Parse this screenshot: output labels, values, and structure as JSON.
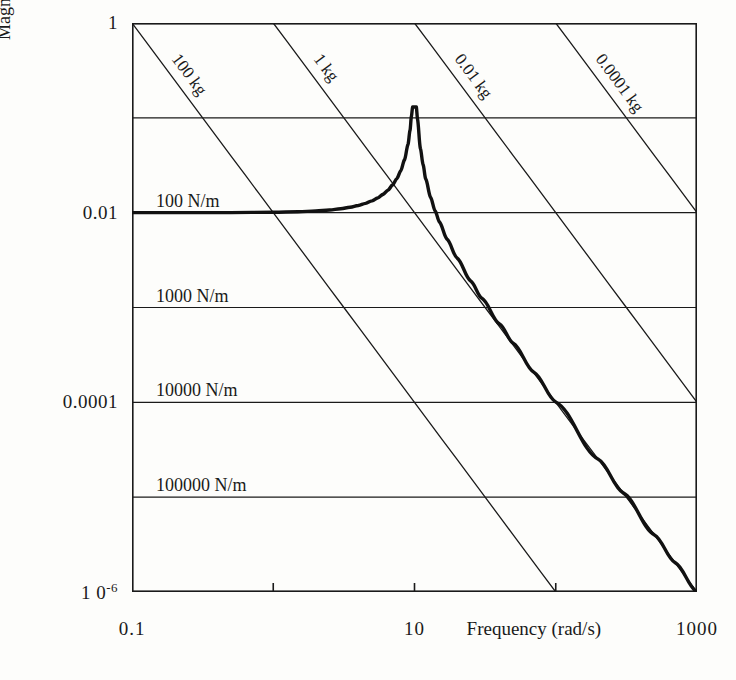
{
  "chart_data": {
    "type": "line",
    "title": "",
    "xlabel": "Frequency (rad/s)",
    "ylabel": "Magnitude of receptance (m/N)",
    "xscale": "log",
    "yscale": "log",
    "xlim": [
      0.1,
      1000
    ],
    "ylim": [
      1e-06,
      1
    ],
    "grid": true,
    "legend": "none",
    "x_ticks": [
      {
        "value": 0.1,
        "label": "0.1"
      },
      {
        "value": 1,
        "label": ""
      },
      {
        "value": 10,
        "label": "10"
      },
      {
        "value": 100,
        "label": ""
      },
      {
        "value": 1000,
        "label": "1000"
      }
    ],
    "y_ticks": [
      {
        "value": 1,
        "label": "1"
      },
      {
        "value": 0.1,
        "label": ""
      },
      {
        "value": 0.01,
        "label": "0.01"
      },
      {
        "value": 0.001,
        "label": ""
      },
      {
        "value": 0.0001,
        "label": "0.0001"
      },
      {
        "value": 1e-05,
        "label": ""
      },
      {
        "value": 1e-06,
        "label": "1 0",
        "label_sup": "-6"
      }
    ],
    "stiffness_lines": [
      {
        "label": "100 N/m",
        "receptance": 0.01
      },
      {
        "label": "1000 N/m",
        "receptance": 0.001
      },
      {
        "label": "10000 N/m",
        "receptance": 0.0001
      },
      {
        "label": "100000 N/m",
        "receptance": 1e-05
      }
    ],
    "mass_lines": [
      {
        "label": "100 kg",
        "mass_kg": 100,
        "x_at_top": 0.1
      },
      {
        "label": "1 kg",
        "mass_kg": 1,
        "x_at_top": 1
      },
      {
        "label": "0.01 kg",
        "mass_kg": 0.01,
        "x_at_top": 10
      },
      {
        "label": "0.0001 kg",
        "mass_kg": 0.0001,
        "x_at_top": 100
      }
    ],
    "series": [
      {
        "name": "receptance",
        "comment": "single-DOF receptance: stiffness k=100 N/m asymptote at low frequency, resonance peak at 10 rad/s, mass asymptote m=1 kg above resonance",
        "resonance_rad_s": 10,
        "low_freq_asymptote": 0.01,
        "peak_value": 0.13,
        "points": [
          [
            0.1,
            0.01
          ],
          [
            0.2,
            0.01
          ],
          [
            0.5,
            0.01002
          ],
          [
            1.0,
            0.0101
          ],
          [
            1.5,
            0.01023
          ],
          [
            2.0,
            0.01042
          ],
          [
            2.5,
            0.01067
          ],
          [
            3.0,
            0.01099
          ],
          [
            3.5,
            0.0114
          ],
          [
            4.0,
            0.0119
          ],
          [
            4.5,
            0.01253
          ],
          [
            5.0,
            0.01333
          ],
          [
            5.5,
            0.01434
          ],
          [
            6.0,
            0.01563
          ],
          [
            6.5,
            0.01732
          ],
          [
            7.0,
            0.01961
          ],
          [
            7.5,
            0.02286
          ],
          [
            8.0,
            0.02778
          ],
          [
            8.5,
            0.03613
          ],
          [
            9.0,
            0.05263
          ],
          [
            9.3,
            0.07407
          ],
          [
            9.5,
            0.10256
          ],
          [
            9.7,
            0.13,
            0
          ],
          [
            10.0,
            0.13
          ],
          [
            10.3,
            0.13
          ],
          [
            10.5,
            0.09756
          ],
          [
            11.0,
            0.04762
          ],
          [
            11.5,
            0.03226
          ],
          [
            12.0,
            0.02273
          ],
          [
            13.0,
            0.01449
          ],
          [
            14.0,
            0.01042
          ],
          [
            15.0,
            0.008
          ],
          [
            17.0,
            0.00526
          ],
          [
            20.0,
            0.00333
          ],
          [
            25.0,
            0.0019
          ],
          [
            30.0,
            0.00125
          ],
          [
            40.0,
            0.00067
          ],
          [
            50.0,
            0.00042
          ],
          [
            70.0,
            0.000208
          ],
          [
            100.0,
            0.000101
          ],
          [
            200.0,
            2.51e-05
          ],
          [
            300.0,
            1.11e-05
          ],
          [
            500.0,
            4e-06
          ],
          [
            700.0,
            2.04e-06
          ],
          [
            1000.0,
            1e-06
          ]
        ]
      }
    ]
  },
  "axis": {
    "y_title": "Magnitude of receptance (m/N)",
    "x_title": "Frequency (rad/s)"
  }
}
